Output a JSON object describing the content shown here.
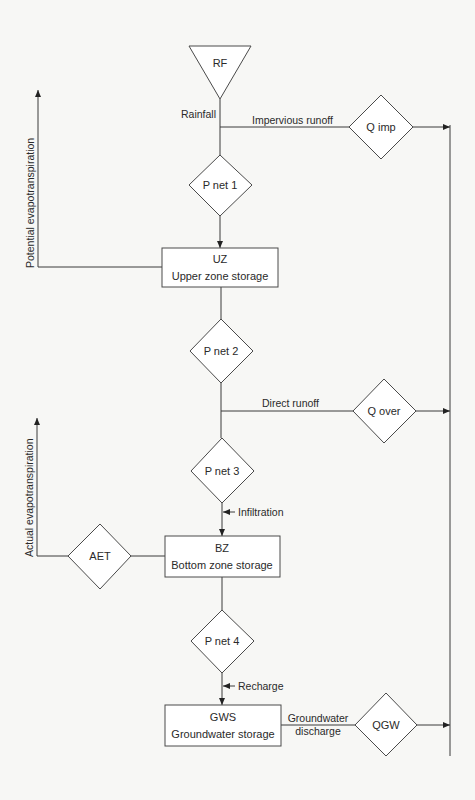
{
  "diagram": {
    "colors": {
      "line": "#3a3a3a",
      "shape_fill": "#ffffff",
      "background": "#f7f7f5",
      "text": "#2a2a2a"
    },
    "nodes": {
      "rf": {
        "label": "RF",
        "shape": "triangle-down"
      },
      "pnet1": {
        "label": "P net 1",
        "shape": "diamond"
      },
      "qimp": {
        "label": "Q imp",
        "shape": "diamond"
      },
      "uz": {
        "code": "UZ",
        "label": "Upper zone storage",
        "shape": "box"
      },
      "pnet2": {
        "label": "P net 2",
        "shape": "diamond"
      },
      "qover": {
        "label": "Q over",
        "shape": "diamond"
      },
      "pnet3": {
        "label": "P net 3",
        "shape": "diamond"
      },
      "bz": {
        "code": "BZ",
        "label": "Bottom zone storage",
        "shape": "box"
      },
      "aet": {
        "label": "AET",
        "shape": "diamond"
      },
      "pnet4": {
        "label": "P net 4",
        "shape": "diamond"
      },
      "gws": {
        "code": "GWS",
        "label": "Groundwater storage",
        "shape": "box"
      },
      "qgw": {
        "label": "QGW",
        "shape": "diamond"
      }
    },
    "flows": {
      "rainfall": "Rainfall",
      "impervious_runoff": "Impervious runoff",
      "potential_et": "Potential evapotranspiration",
      "direct_runoff": "Direct runoff",
      "infiltration": "Infiltration",
      "actual_et": "Actual evapotranspiration",
      "recharge": "Recharge",
      "groundwater_discharge_1": "Groundwater",
      "groundwater_discharge_2": "discharge"
    }
  }
}
